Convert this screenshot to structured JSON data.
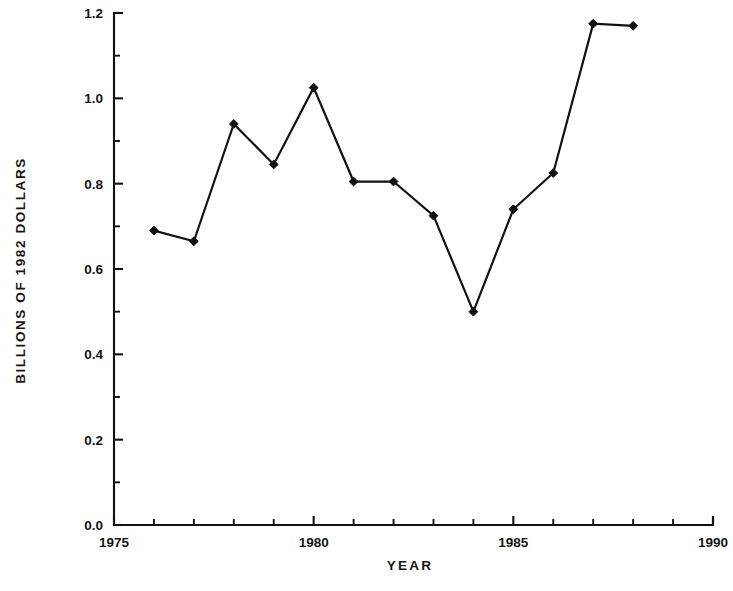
{
  "chart_data": {
    "type": "line",
    "title": "",
    "xlabel": "YEAR",
    "ylabel": "BILLIONS OF 1982 DOLLARS",
    "x": [
      1976,
      1977,
      1978,
      1979,
      1980,
      1981,
      1982,
      1983,
      1984,
      1985,
      1986,
      1987,
      1988
    ],
    "values": [
      0.69,
      0.665,
      0.94,
      0.845,
      1.025,
      0.805,
      0.805,
      0.725,
      0.5,
      0.74,
      0.825,
      1.175,
      1.17
    ],
    "xlim": [
      1975,
      1990
    ],
    "ylim": [
      0.0,
      1.2
    ],
    "xticks": [
      1975,
      1980,
      1985,
      1990
    ],
    "xtick_labels": [
      "1975",
      "1980",
      "1985",
      "1990"
    ],
    "xminor_step": 1,
    "yticks": [
      0.0,
      0.2,
      0.4,
      0.6,
      0.8,
      1.0,
      1.2
    ],
    "ytick_labels": [
      "0.0",
      "0.2",
      "0.4",
      "0.6",
      "0.8",
      "1.0",
      "1.2"
    ],
    "yminor_step": 0.1,
    "grid": false,
    "legend": null,
    "marker": "diamond",
    "line_color": "#111111",
    "marker_color": "#111111",
    "background_color": "#ffffff"
  }
}
